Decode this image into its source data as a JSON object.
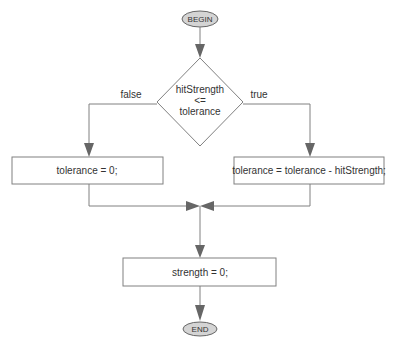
{
  "diagram": {
    "type": "flowchart",
    "start": {
      "label": "BEGIN"
    },
    "decision": {
      "line1": "hitStrength",
      "line2": "<=",
      "line3": "tolerance"
    },
    "branches": {
      "false_label": "false",
      "true_label": "true"
    },
    "false_action": {
      "label": "tolerance = 0;"
    },
    "true_action": {
      "label": "tolerance = tolerance - hitStrength;"
    },
    "merge_action": {
      "label": "strength = 0;"
    },
    "end": {
      "label": "END"
    }
  }
}
